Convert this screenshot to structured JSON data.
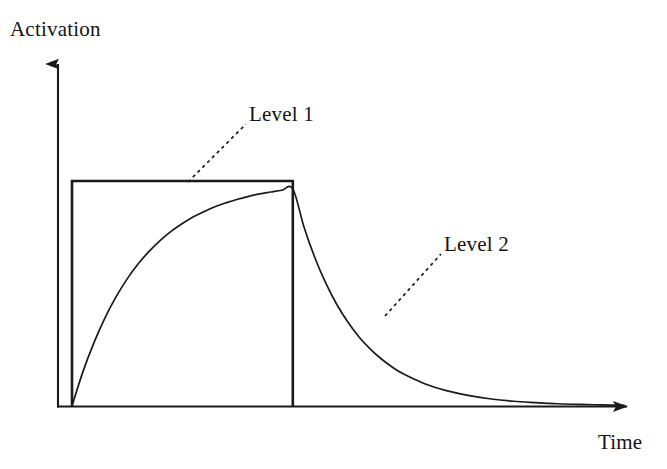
{
  "figure": {
    "background_color": "#ffffff",
    "ink_color": "#1a1a1a",
    "axis_label_y": "Activation",
    "axis_label_x": "Time"
  },
  "annotations": {
    "level_1": {
      "label": "Level 1",
      "leader_from_x": 188,
      "leader_from_y": 182,
      "leader_to_x": 246,
      "leader_to_y": 124
    },
    "level_2": {
      "label": "Level 2",
      "leader_from_x": 385,
      "leader_from_y": 316,
      "leader_to_x": 441,
      "leader_to_y": 254
    }
  },
  "chart_data": {
    "type": "line",
    "title": "",
    "subtitle": "",
    "xlabel": "Time",
    "ylabel": "Activation",
    "grid": false,
    "legend_position": "inline-annotations",
    "axis_style": "arrow-headed open axes, no tick marks, no tick labels",
    "xlim": [
      0,
      100
    ],
    "ylim": [
      0,
      1.15
    ],
    "axis_pixels": {
      "origin_x": 58,
      "origin_y": 406,
      "y_axis_arrow_tip_y": 52,
      "x_axis_arrow_tip_x": 640,
      "plateau_y": 181,
      "pulse_start_x": 72,
      "pulse_end_x": 318
    },
    "series": [
      {
        "name": "Level 1",
        "description": "Rectangular input pulse: instantaneous step up to full activation at stimulus onset, held constant, then instantaneous step down to zero at stimulus offset.",
        "shape": "step",
        "linestyle": "solid",
        "linewidth": 2.6,
        "color": "#1a1a1a",
        "x": [
          0,
          0,
          40,
          40
        ],
        "y": [
          0,
          1,
          1,
          0
        ],
        "key_points": {
          "onset_time": 0,
          "offset_time": 40,
          "plateau_level": 1.0
        }
      },
      {
        "name": "Level 2",
        "description": "Smoothed activation: exponential rise toward the Level 1 plateau while the pulse is on, then exponential decay back toward zero after the pulse turns off.",
        "shape": "exponential-rise-then-decay",
        "linestyle": "solid",
        "linewidth": 1.7,
        "color": "#1a1a1a",
        "rise_time_constant": 12.0,
        "decay_time_constant": 9.5,
        "x": [
          0,
          2,
          4,
          6,
          8,
          10,
          12,
          14,
          16,
          18,
          20,
          22,
          24,
          26,
          28,
          30,
          32,
          34,
          36,
          38,
          40,
          42,
          44,
          46,
          48,
          50,
          52,
          54,
          56,
          58,
          60,
          64,
          68,
          72,
          76,
          80,
          84,
          88,
          92,
          96,
          100
        ],
        "y": [
          0.0,
          0.154,
          0.283,
          0.393,
          0.486,
          0.565,
          0.632,
          0.688,
          0.736,
          0.777,
          0.811,
          0.841,
          0.865,
          0.887,
          0.904,
          0.919,
          0.932,
          0.943,
          0.951,
          0.959,
          0.965,
          0.798,
          0.659,
          0.545,
          0.45,
          0.372,
          0.307,
          0.254,
          0.21,
          0.173,
          0.143,
          0.098,
          0.067,
          0.046,
          0.031,
          0.021,
          0.015,
          0.01,
          0.007,
          0.005,
          0.003
        ]
      }
    ]
  }
}
